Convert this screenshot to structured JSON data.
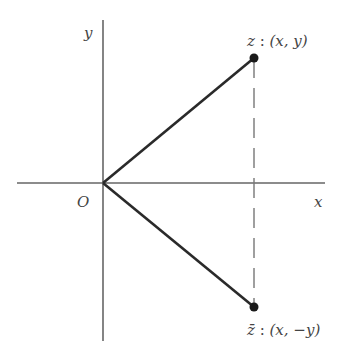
{
  "diagram": {
    "axes": {
      "x_label": "x",
      "y_label": "y",
      "origin_label": "O",
      "color": "#555555"
    },
    "points": {
      "z": {
        "label_name": "z",
        "label_coords": "(x, y)",
        "full_label": "z : (x, y)"
      },
      "z_conjugate": {
        "label_name": "z̄",
        "label_coords": "(x, −y)",
        "full_label": "z̄ : (x, −y)"
      }
    },
    "segments": [
      {
        "from": "O",
        "to": "z",
        "style": "solid"
      },
      {
        "from": "O",
        "to": "z̄",
        "style": "solid"
      },
      {
        "from": "z",
        "to": "z̄",
        "style": "dashed"
      }
    ],
    "line_color": "#2a2a2a"
  }
}
